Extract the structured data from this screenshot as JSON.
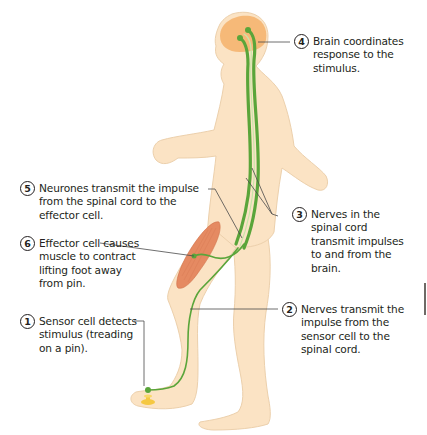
{
  "diagram": {
    "colors": {
      "skin": "#fbe3c4",
      "skin_outline": "#e8c9a2",
      "brain": "#f5b26b",
      "nerve": "#5aa53a",
      "nerve_light": "#c8e6a8",
      "muscle": "#e58a62",
      "pin": "#f5c842",
      "leader_line": "#4a4a4a",
      "text": "#231f20"
    },
    "steps": [
      {
        "number": "1",
        "text": "Sensor cell detects\nstimulus (treading\non a pin).",
        "target": "foot sensor cell"
      },
      {
        "number": "2",
        "text": "Nerves transmit the\nimpulse from the\nsensor cell to the\nspinal cord.",
        "target": "leg nerve"
      },
      {
        "number": "3",
        "text": "Nerves in the\nspinal cord\ntransmit impulses\nto and from the\nbrain.",
        "target": "spinal cord"
      },
      {
        "number": "4",
        "text": "Brain coordinates\nresponse to the\nstimulus.",
        "target": "brain"
      },
      {
        "number": "5",
        "text": "Neurones transmit the impulse\nfrom the spinal cord to the\neffector cell.",
        "target": "motor neurone"
      },
      {
        "number": "6",
        "text": "Effector cell causes\nmuscle to contract\nlifting foot away\nfrom pin.",
        "target": "thigh muscle"
      }
    ]
  }
}
